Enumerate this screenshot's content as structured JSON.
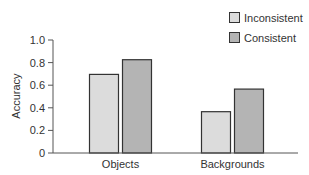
{
  "chart_data": {
    "type": "bar",
    "title": "",
    "xlabel": "",
    "ylabel": "Accuracy",
    "ylim": [
      0,
      1.0
    ],
    "yticks": [
      0,
      0.2,
      0.4,
      0.6,
      0.8,
      1.0
    ],
    "ytick_labels": [
      "0",
      "0.2",
      "0.4",
      "0.6",
      "0.8",
      "1.0"
    ],
    "grid": false,
    "legend_position": "top-right",
    "categories": [
      "Objects",
      "Backgrounds"
    ],
    "series": [
      {
        "name": "Inconsistent",
        "values": [
          0.7,
          0.37
        ],
        "color": "#dcdcdc"
      },
      {
        "name": "Consistent",
        "values": [
          0.83,
          0.57
        ],
        "color": "#b4b4b4"
      }
    ]
  },
  "colors": {
    "axis": "#555555",
    "bar_border": "#333333",
    "text": "#333333"
  }
}
